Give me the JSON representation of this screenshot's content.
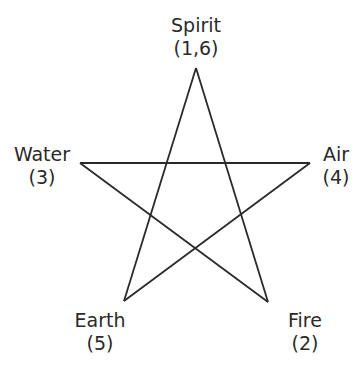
{
  "diagram": {
    "type": "pentagram",
    "line_color": "#2a2a2a",
    "text_color": "#2a2a2a",
    "background": "#ffffff",
    "points": [
      {
        "id": "spirit",
        "name": "Spirit",
        "number": "(1,6)",
        "x": 196,
        "y": 68
      },
      {
        "id": "water",
        "name": "Water",
        "number": "(3)",
        "x": 80,
        "y": 163
      },
      {
        "id": "air",
        "name": "Air",
        "number": "(4)",
        "x": 310,
        "y": 163
      },
      {
        "id": "earth",
        "name": "Earth",
        "number": "(5)",
        "x": 124,
        "y": 301
      },
      {
        "id": "fire",
        "name": "Fire",
        "number": "(2)",
        "x": 268,
        "y": 302
      }
    ],
    "edges": [
      [
        "spirit",
        "fire"
      ],
      [
        "fire",
        "water"
      ],
      [
        "water",
        "air"
      ],
      [
        "air",
        "earth"
      ],
      [
        "earth",
        "spirit"
      ]
    ]
  }
}
